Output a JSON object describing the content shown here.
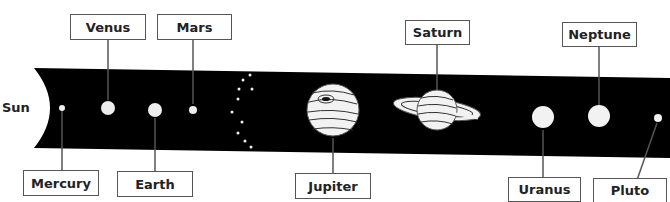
{
  "sun": {
    "label": "Sun"
  },
  "planets": [
    {
      "name": "Mercury",
      "label": "Mercury"
    },
    {
      "name": "Venus",
      "label": "Venus"
    },
    {
      "name": "Earth",
      "label": "Earth"
    },
    {
      "name": "Mars",
      "label": "Mars"
    },
    {
      "name": "Jupiter",
      "label": "Jupiter"
    },
    {
      "name": "Saturn",
      "label": "Saturn"
    },
    {
      "name": "Uranus",
      "label": "Uranus"
    },
    {
      "name": "Neptune",
      "label": "Neptune"
    },
    {
      "name": "Pluto",
      "label": "Pluto"
    }
  ],
  "colors": {
    "space": "#000000",
    "planet": "#f2f2f2",
    "border": "#555555",
    "text": "#222222"
  }
}
